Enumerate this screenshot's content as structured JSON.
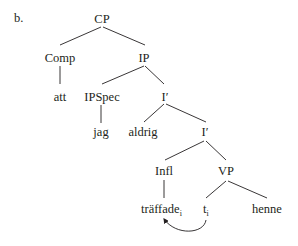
{
  "example_label": "b.",
  "nodes": {
    "cp": "CP",
    "comp": "Comp",
    "ip": "IP",
    "att": "att",
    "ipspec": "IPSpec",
    "ibar_1": "I′",
    "jag": "jag",
    "aldrig": "aldrig",
    "ibar_2": "I′",
    "infl": "Infl",
    "vp": "VP",
    "traffade": "träffade",
    "traffade_index": "i",
    "trace": "t",
    "trace_index": "i",
    "henne": "henne"
  },
  "movement_arrow": {
    "from": "trace",
    "to": "traffade"
  },
  "colors": {
    "ink": "#231f20",
    "background": "#ffffff"
  }
}
